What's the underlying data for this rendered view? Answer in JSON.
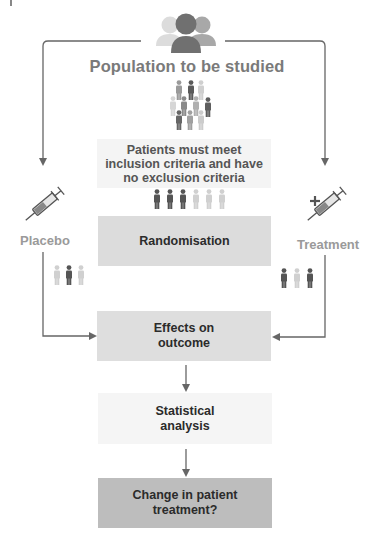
{
  "diagram": {
    "title": "Population to be studied",
    "criteria_box": {
      "label": "Patients must meet inclusion criteria and have no exclusion criteria",
      "line1": "Patients must meet",
      "line2": "inclusion criteria and have",
      "line3": "no exclusion criteria",
      "color": "#f4f4f4"
    },
    "randomisation_box": {
      "label": "Randomisation",
      "color": "#dcdcdc"
    },
    "effects_box": {
      "line1": "Effects on",
      "line2": "outcome",
      "color": "#dedede"
    },
    "statistical_box": {
      "line1": "Statistical",
      "line2": "analysis",
      "color": "#f5f5f5"
    },
    "change_box": {
      "line1": "Change in patient",
      "line2": "treatment?",
      "color": "#bdbdbd"
    },
    "placebo": {
      "label": "Placebo",
      "icon": "syringe-icon"
    },
    "treatment": {
      "label": "Treatment",
      "icon": "syringe-plus-icon"
    },
    "icons": {
      "group": "group-people-icon",
      "crowd": "crowd-icon",
      "six_people": "six-people-icon",
      "placebo_group": "three-people-icon",
      "treatment_group": "three-people-icon"
    },
    "colors": {
      "line": "#6e6e6e",
      "person_dark": "#555555",
      "person_mid": "#8e8e8e",
      "person_light": "#cfcfcf",
      "title_text": "#7a7a7a",
      "side_text": "#9a9a9a"
    }
  }
}
